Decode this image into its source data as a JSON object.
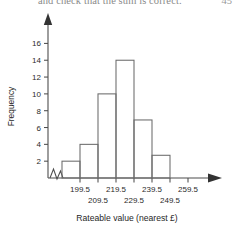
{
  "page": {
    "header_text": "and check that the sum is correct.",
    "page_number": "45"
  },
  "chart_data": {
    "type": "bar",
    "title": "",
    "subtitle": "",
    "xlabel": "Rateable value (nearest £)",
    "ylabel": "Frequency",
    "categories": [
      "189.5–199.5",
      "199.5–209.5",
      "209.5–219.5",
      "219.5–229.5",
      "229.5–239.5",
      "239.5–249.5"
    ],
    "bin_edges": [
      189.5,
      199.5,
      209.5,
      219.5,
      229.5,
      239.5,
      249.5
    ],
    "values": [
      2,
      4,
      10,
      14,
      6.9,
      2.7
    ],
    "ylim": [
      0,
      17
    ],
    "xlim": [
      184.5,
      264.5
    ],
    "ytick_labels": [
      "2",
      "4",
      "6",
      "8",
      "10",
      "12",
      "14",
      "16"
    ],
    "ytick_values": [
      2,
      4,
      6,
      8,
      10,
      12,
      14,
      16
    ],
    "xtick_labels_upper": [
      "199.5",
      "219.5",
      "239.5",
      "259.5"
    ],
    "xtick_values_upper": [
      199.5,
      219.5,
      239.5,
      259.5
    ],
    "xtick_labels_lower": [
      "209.5",
      "229.5",
      "249.5"
    ],
    "xtick_values_lower": [
      209.5,
      229.5,
      249.5
    ],
    "grid": false,
    "legend": false,
    "axis_break": true,
    "bar_fill": "none",
    "bar_stroke": "#6b6b6b",
    "axis_color": "#4d4d4d"
  }
}
